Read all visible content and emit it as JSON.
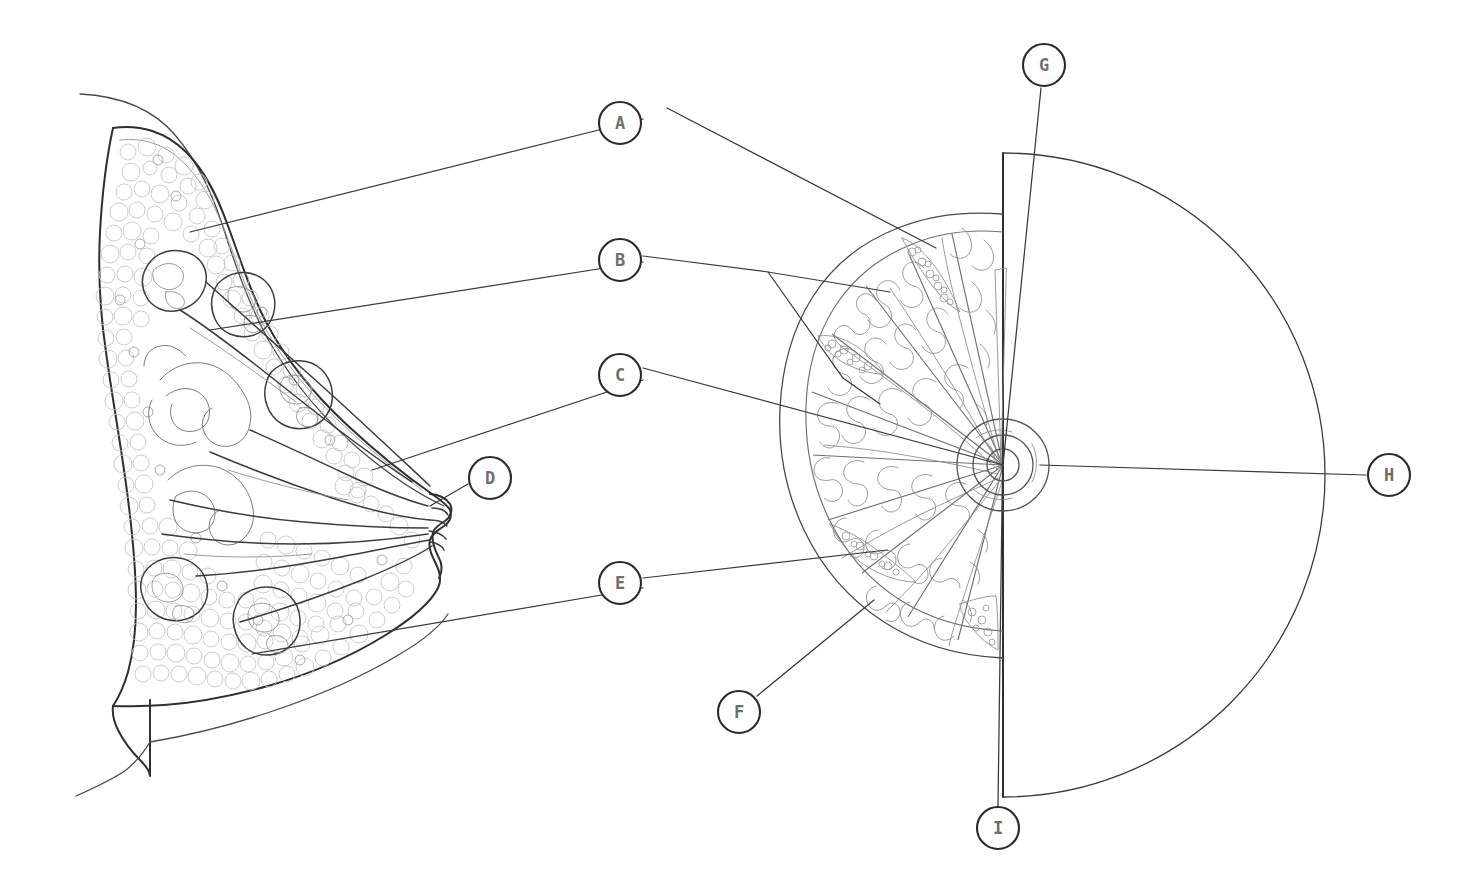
{
  "figure": {
    "background_color": "#ffffff",
    "line_color": "#3a3a3a",
    "label_text_color": "#6e6e6e",
    "label_ring_color": "#2b2b2b",
    "width": 1467,
    "height": 893
  },
  "views": [
    {
      "id": "sagittal-view",
      "name": "sagittal-cross-section",
      "position": "left",
      "description": "Side cross-section of the breast showing chest wall, fatty tissue, glandular lobules, lactiferous ducts and nipple"
    },
    {
      "id": "frontal-view",
      "name": "frontal-cutaway-view",
      "position": "right",
      "description": "Front view of the breast, left half cut away to reveal radial lobes and ducts converging on the nipple, right half showing intact skin outline"
    }
  ],
  "callouts": [
    {
      "id": "A",
      "letter": "A",
      "cx": 620,
      "cy": 123,
      "target_view": "frontal-view"
    },
    {
      "id": "B",
      "letter": "B",
      "cx": 620,
      "cy": 260,
      "target_view": "frontal-view"
    },
    {
      "id": "C",
      "letter": "C",
      "cx": 620,
      "cy": 375,
      "target_view": "frontal-view"
    },
    {
      "id": "D",
      "letter": "D",
      "cx": 490,
      "cy": 478,
      "target_view": "sagittal-view"
    },
    {
      "id": "E",
      "letter": "E",
      "cx": 620,
      "cy": 583,
      "target_view": "frontal-view"
    },
    {
      "id": "F",
      "letter": "F",
      "cx": 739,
      "cy": 712,
      "target_view": "frontal-view"
    },
    {
      "id": "G",
      "letter": "G",
      "cx": 1044,
      "cy": 65,
      "target_view": "frontal-view"
    },
    {
      "id": "H",
      "letter": "H",
      "cx": 1389,
      "cy": 475,
      "target_view": "frontal-view"
    },
    {
      "id": "I",
      "letter": "I",
      "cx": 998,
      "cy": 828,
      "target_view": "frontal-view"
    }
  ],
  "callout_style": {
    "radius": 21,
    "font_size": 17,
    "stroke_width": 2.1
  },
  "sagittal_leaders": [
    {
      "from": "A",
      "note": "long line from upper-left of sagittal section to superior fatty tissue"
    },
    {
      "from": "B",
      "note": "line to glandular lobule in mid section"
    },
    {
      "from": "C",
      "note": "line to lactiferous duct"
    },
    {
      "from": "D",
      "note": "short line to nipple"
    },
    {
      "from": "E",
      "note": "line to lower lobule"
    }
  ]
}
